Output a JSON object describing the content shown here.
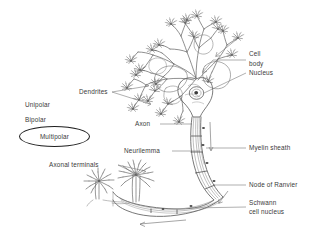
{
  "figure": {
    "style": "hand-drawn pencil sketch",
    "background_color": "#ffffff",
    "ink_color": "#555555",
    "text_color": "#3a3a3a"
  },
  "neuron_types": {
    "items": [
      {
        "label": "Unipolar",
        "selected": false
      },
      {
        "label": "Bipolar",
        "selected": false
      },
      {
        "label": "Multipolar",
        "selected": true
      }
    ],
    "selection_marker": "ellipse-outline"
  },
  "labels": {
    "dendrites": "Dendrites",
    "cell": "Cell",
    "body": "body",
    "nucleus": "Nucleus",
    "axon": "Axon",
    "neurilemma": "Neurilemma",
    "myelin_sheath": "Myelin sheath",
    "axonal_terminals": "Axonal terminals",
    "node_of_ranvier": "Node of Ranvier",
    "schwann": "Schwann",
    "cell_nucleus": "cell nucleus",
    "unipolar": "Unipolar",
    "bipolar": "Bipolar",
    "multipolar": "Multipolar"
  },
  "parts": {
    "dendrite_tree": "dendrite-tree",
    "soma": "soma-cell-body",
    "nucleus": "nucleus",
    "axon_hillock": "axon-hillock",
    "myelinated_axon": "myelinated-axon",
    "nodes": "nodes-of-ranvier",
    "terminals": "axon-terminal-arbors"
  }
}
